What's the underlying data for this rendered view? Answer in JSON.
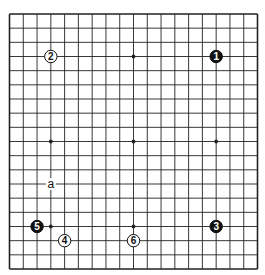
{
  "diagram": {
    "type": "go-board",
    "size": 19,
    "geometry": {
      "left": 9.5,
      "top": 14,
      "right": 257.5,
      "bottom": 269
    },
    "colors": {
      "background": "#ffffff",
      "grid": "#222222",
      "black_stone": "#111111",
      "white_stone": "#ffffff",
      "stone_outline": "#111111",
      "black_text": "#ffffff",
      "white_text": "#111111"
    },
    "hoshi": [
      [
        3,
        3
      ],
      [
        9,
        3
      ],
      [
        15,
        3
      ],
      [
        3,
        9
      ],
      [
        9,
        9
      ],
      [
        15,
        9
      ],
      [
        3,
        15
      ],
      [
        9,
        15
      ],
      [
        15,
        15
      ]
    ],
    "stones": [
      {
        "number": "1",
        "color": "black",
        "col": 15,
        "row": 3
      },
      {
        "number": "2",
        "color": "white",
        "col": 3,
        "row": 3
      },
      {
        "number": "3",
        "color": "black",
        "col": 15,
        "row": 15
      },
      {
        "number": "4",
        "color": "white",
        "col": 4,
        "row": 16
      },
      {
        "number": "5",
        "color": "black",
        "col": 2,
        "row": 15
      },
      {
        "number": "6",
        "color": "white",
        "col": 9,
        "row": 16
      }
    ],
    "labels": [
      {
        "text": "a",
        "col": 3,
        "row": 12
      }
    ]
  }
}
